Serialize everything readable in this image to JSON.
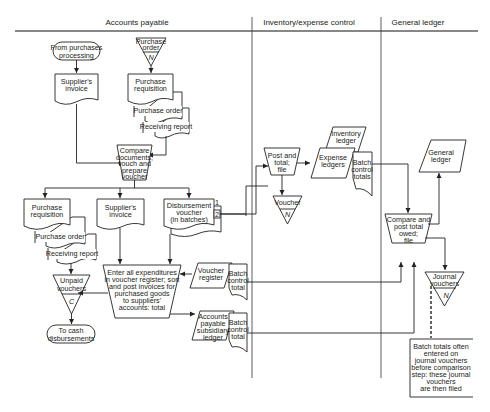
{
  "swimlanes": [
    {
      "id": "ap",
      "title": "Accounts payable"
    },
    {
      "id": "inv",
      "title": "Inventory/expense control"
    },
    {
      "id": "gl",
      "title": "General ledger"
    }
  ],
  "nodes": {
    "from_purchases": {
      "type": "terminator",
      "lines": [
        "From purchases",
        "processing"
      ]
    },
    "po_file": {
      "type": "offline-file",
      "lines": [
        "Purchase",
        "order"
      ],
      "mark": "N"
    },
    "suppliers_invoice_top": {
      "type": "document",
      "lines": [
        "Supplier's",
        "invoice"
      ]
    },
    "purchase_req_top": {
      "type": "document",
      "lines": [
        "Purchase",
        "requisition"
      ]
    },
    "purchase_order_top": {
      "type": "document",
      "lines": [
        "Purchase order"
      ]
    },
    "receiving_report_top": {
      "type": "document",
      "lines": [
        "Receiving report"
      ]
    },
    "compare_docs": {
      "type": "manual-operation",
      "lines": [
        "Compare",
        "documents;",
        "vouch and",
        "prepare",
        "voucher"
      ]
    },
    "purchase_req_mid": {
      "type": "document",
      "lines": [
        "Purchase",
        "requisition"
      ]
    },
    "purchase_order_mid": {
      "type": "document",
      "lines": [
        "Purchase order"
      ]
    },
    "receiving_report_mid": {
      "type": "document",
      "lines": [
        "Receiving report"
      ]
    },
    "suppliers_invoice_mid": {
      "type": "document",
      "lines": [
        "Supplier's",
        "invoice"
      ]
    },
    "disbursement_voucher": {
      "type": "document",
      "lines": [
        "Disbursement",
        "voucher",
        "(in batches)"
      ],
      "copy_marks": [
        "1",
        "2"
      ]
    },
    "unpaid_vouchers": {
      "type": "offline-file",
      "lines": [
        "Unpaid",
        "vouchers"
      ],
      "mark": "C"
    },
    "to_cash": {
      "type": "terminator",
      "lines": [
        "To cash",
        "disbursements"
      ]
    },
    "enter_expenditures": {
      "type": "manual-operation",
      "lines": [
        "Enter all expenditures",
        "in voucher register; sort",
        "and post invoices for",
        "purchased goods",
        "to suppliers'",
        "accounts: total"
      ]
    },
    "voucher_register": {
      "type": "io",
      "lines": [
        "Voucher",
        "register"
      ]
    },
    "batch_total_1": {
      "type": "document",
      "lines": [
        "Batch",
        "control",
        "total"
      ]
    },
    "ap_subsidiary": {
      "type": "io",
      "lines": [
        "Accounts",
        "payable",
        "subsidiary",
        "ledger"
      ]
    },
    "batch_total_2": {
      "type": "document",
      "lines": [
        "Batch",
        "control",
        "total"
      ]
    },
    "post_and_total": {
      "type": "manual-operation",
      "lines": [
        "Post and",
        "total;",
        "file"
      ]
    },
    "voucher_file": {
      "type": "offline-file",
      "lines": [
        "Voucher"
      ],
      "mark": "N"
    },
    "inventory_ledger": {
      "type": "io",
      "lines": [
        "Inventory",
        "ledger"
      ]
    },
    "expense_ledgers": {
      "type": "io",
      "lines": [
        "Expense",
        "ledgers"
      ]
    },
    "batch_totals_inv": {
      "type": "document",
      "lines": [
        "Batch",
        "control",
        "totals"
      ]
    },
    "general_ledger": {
      "type": "io",
      "lines": [
        "General",
        "ledger"
      ]
    },
    "compare_post": {
      "type": "manual-operation",
      "lines": [
        "Compare and",
        "post total",
        "owed;",
        "file"
      ]
    },
    "journal_vouchers": {
      "type": "offline-file",
      "lines": [
        "Journal",
        "vouchers"
      ],
      "mark": "N"
    },
    "annotation": {
      "type": "annotation",
      "lines": [
        "Batch totals often",
        "entered on",
        "journal vouchers",
        "before comparison",
        "step: these journal",
        "vouchers",
        "are then filed"
      ]
    }
  }
}
